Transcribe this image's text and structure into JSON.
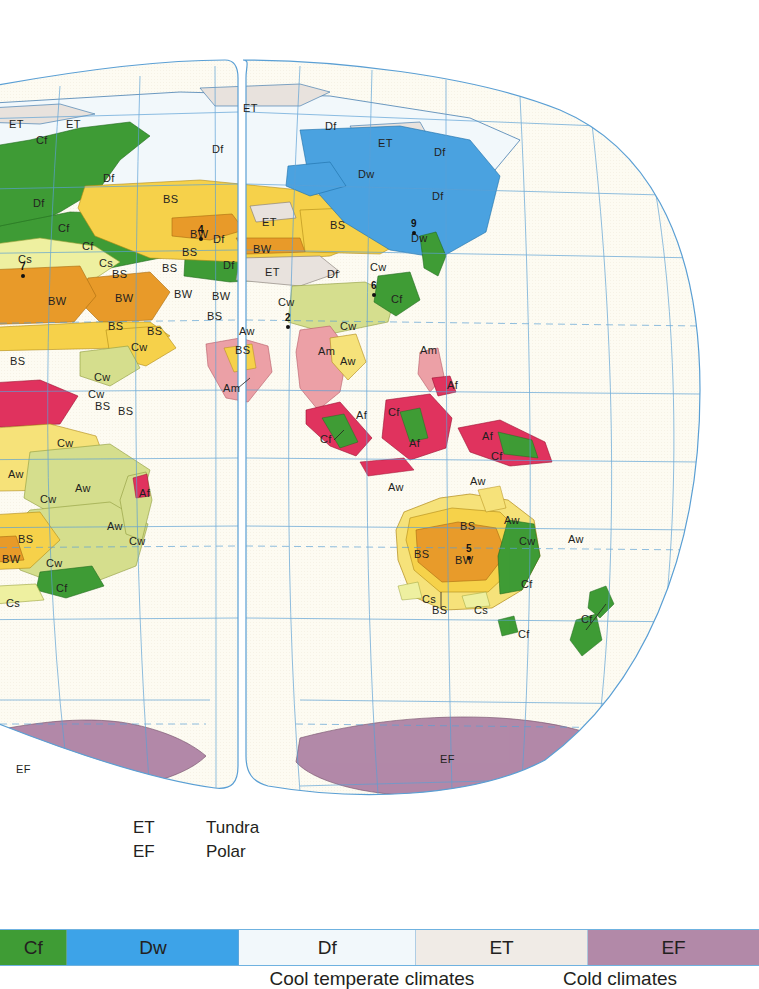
{
  "document": {
    "kind": "climate-classification-map",
    "region_shown": "Eastern Hemisphere — Europe, Asia, Africa, Australia, Antarctica"
  },
  "map": {
    "projection": "interrupted-oval",
    "background_color": "#fdfbf2",
    "graticule_color": "#5a9fd4",
    "coastline_color": "#2f6fa8",
    "labels": [
      {
        "text": "ET",
        "x": 9,
        "y": 118
      },
      {
        "text": "ET",
        "x": 66,
        "y": 118
      },
      {
        "text": "Cf",
        "x": 36,
        "y": 134
      },
      {
        "text": "ET",
        "x": 243,
        "y": 102
      },
      {
        "text": "Df",
        "x": 325,
        "y": 120
      },
      {
        "text": "ET",
        "x": 378,
        "y": 137
      },
      {
        "text": "Df",
        "x": 434,
        "y": 146
      },
      {
        "text": "Df",
        "x": 103,
        "y": 172
      },
      {
        "text": "Df",
        "x": 212,
        "y": 143
      },
      {
        "text": "Dw",
        "x": 358,
        "y": 168
      },
      {
        "text": "Df",
        "x": 432,
        "y": 190
      },
      {
        "text": "Cf",
        "x": 58,
        "y": 222
      },
      {
        "text": "BS",
        "x": 163,
        "y": 193
      },
      {
        "text": "BW",
        "x": 190,
        "y": 228
      },
      {
        "text": "ET",
        "x": 262,
        "y": 216
      },
      {
        "text": "BS",
        "x": 330,
        "y": 219
      },
      {
        "text": "Dw",
        "x": 411,
        "y": 232
      },
      {
        "text": "Df",
        "x": 33,
        "y": 197
      },
      {
        "text": "Cf",
        "x": 82,
        "y": 240
      },
      {
        "text": "BS",
        "x": 182,
        "y": 246
      },
      {
        "text": "Df",
        "x": 213,
        "y": 233
      },
      {
        "text": "BW",
        "x": 253,
        "y": 243
      },
      {
        "text": "Cs",
        "x": 18,
        "y": 253
      },
      {
        "text": "Cs",
        "x": 99,
        "y": 257
      },
      {
        "text": "BS",
        "x": 162,
        "y": 262
      },
      {
        "text": "Df",
        "x": 223,
        "y": 259
      },
      {
        "text": "ET",
        "x": 265,
        "y": 266
      },
      {
        "text": "Df",
        "x": 327,
        "y": 268
      },
      {
        "text": "Cw",
        "x": 370,
        "y": 261
      },
      {
        "text": "Cf",
        "x": 391,
        "y": 293
      },
      {
        "text": "BS",
        "x": 112,
        "y": 268
      },
      {
        "text": "BW",
        "x": 48,
        "y": 295
      },
      {
        "text": "BW",
        "x": 115,
        "y": 292
      },
      {
        "text": "BW",
        "x": 174,
        "y": 288
      },
      {
        "text": "BW",
        "x": 212,
        "y": 290
      },
      {
        "text": "Cw",
        "x": 278,
        "y": 296
      },
      {
        "text": "BS",
        "x": 108,
        "y": 320
      },
      {
        "text": "BS",
        "x": 147,
        "y": 325
      },
      {
        "text": "BS",
        "x": 207,
        "y": 310
      },
      {
        "text": "Cw",
        "x": 131,
        "y": 341
      },
      {
        "text": "Aw",
        "x": 239,
        "y": 325
      },
      {
        "text": "Cw",
        "x": 340,
        "y": 320
      },
      {
        "text": "BS",
        "x": 10,
        "y": 355
      },
      {
        "text": "BS",
        "x": 235,
        "y": 344
      },
      {
        "text": "Am",
        "x": 318,
        "y": 345
      },
      {
        "text": "Aw",
        "x": 340,
        "y": 355
      },
      {
        "text": "Am",
        "x": 420,
        "y": 344
      },
      {
        "text": "Cw",
        "x": 88,
        "y": 388
      },
      {
        "text": "Cw",
        "x": 94,
        "y": 371
      },
      {
        "text": "BS",
        "x": 95,
        "y": 400
      },
      {
        "text": "Am",
        "x": 223,
        "y": 382
      },
      {
        "text": "BS",
        "x": 118,
        "y": 405
      },
      {
        "text": "Af",
        "x": 447,
        "y": 379
      },
      {
        "text": "Af",
        "x": 356,
        "y": 409
      },
      {
        "text": "Cf",
        "x": 388,
        "y": 406
      },
      {
        "text": "Af",
        "x": 409,
        "y": 437
      },
      {
        "text": "Af",
        "x": 482,
        "y": 430
      },
      {
        "text": "Cf",
        "x": 320,
        "y": 433
      },
      {
        "text": "Cf",
        "x": 491,
        "y": 450
      },
      {
        "text": "Cw",
        "x": 57,
        "y": 437
      },
      {
        "text": "Aw",
        "x": 8,
        "y": 468
      },
      {
        "text": "Aw",
        "x": 75,
        "y": 482
      },
      {
        "text": "Aw",
        "x": 388,
        "y": 481
      },
      {
        "text": "Aw",
        "x": 470,
        "y": 475
      },
      {
        "text": "Cw",
        "x": 40,
        "y": 493
      },
      {
        "text": "Af",
        "x": 139,
        "y": 487
      },
      {
        "text": "Aw",
        "x": 107,
        "y": 520
      },
      {
        "text": "Cw",
        "x": 129,
        "y": 535
      },
      {
        "text": "BS",
        "x": 18,
        "y": 533
      },
      {
        "text": "BW",
        "x": 2,
        "y": 553
      },
      {
        "text": "Cw",
        "x": 46,
        "y": 557
      },
      {
        "text": "Cf",
        "x": 56,
        "y": 582
      },
      {
        "text": "Cs",
        "x": 6,
        "y": 597
      },
      {
        "text": "BS",
        "x": 460,
        "y": 520
      },
      {
        "text": "Aw",
        "x": 504,
        "y": 514
      },
      {
        "text": "Cw",
        "x": 519,
        "y": 535
      },
      {
        "text": "Aw",
        "x": 568,
        "y": 533
      },
      {
        "text": "BS",
        "x": 414,
        "y": 548
      },
      {
        "text": "BW",
        "x": 455,
        "y": 554
      },
      {
        "text": "Cf",
        "x": 521,
        "y": 578
      },
      {
        "text": "Cs",
        "x": 422,
        "y": 593
      },
      {
        "text": "BS",
        "x": 432,
        "y": 604
      },
      {
        "text": "Cs",
        "x": 474,
        "y": 604
      },
      {
        "text": "Cf",
        "x": 581,
        "y": 613
      },
      {
        "text": "Cf",
        "x": 518,
        "y": 628
      },
      {
        "text": "EF",
        "x": 440,
        "y": 753
      },
      {
        "text": "EF",
        "x": 16,
        "y": 763
      }
    ],
    "markers": [
      {
        "number": "7",
        "x": 20,
        "y": 261
      },
      {
        "number": "4",
        "x": 198,
        "y": 224
      },
      {
        "number": "9",
        "x": 411,
        "y": 218
      },
      {
        "number": "6",
        "x": 371,
        "y": 280
      },
      {
        "number": "2",
        "x": 285,
        "y": 312
      },
      {
        "number": "5",
        "x": 466,
        "y": 543
      }
    ]
  },
  "legend_list": {
    "rows": [
      {
        "code": "ET",
        "name": "Tundra"
      },
      {
        "code": "EF",
        "name": "Polar"
      }
    ]
  },
  "colorbar": {
    "segments": [
      {
        "label": "Cf",
        "color": "#3f9c35",
        "width": 140,
        "text_color": "#231f20"
      },
      {
        "label": "Dw",
        "color": "#3da3e8",
        "width": 360,
        "text_color": "#231f20"
      },
      {
        "label": "Df",
        "color": "#f2f8fb",
        "width": 370,
        "text_color": "#231f20"
      },
      {
        "label": "ET",
        "color": "#f0ebe6",
        "width": 360,
        "text_color": "#231f20"
      },
      {
        "label": "EF",
        "color": "#b289a8",
        "width": 360,
        "text_color": "#231f20"
      }
    ],
    "captions": [
      {
        "text": "Cool temperate climates",
        "center": 372
      },
      {
        "text": "Cold climates",
        "center": 620
      }
    ]
  },
  "palette": {
    "Af": "#e0335e",
    "Am": "#eca0a6",
    "Aw": "#f6e27a",
    "BS": "#f6d24a",
    "BW": "#e89b2a",
    "Cf": "#3f9c35",
    "Cs": "#eef0a0",
    "Cw": "#d5de8e",
    "Df": "#f2f8fb",
    "Dw": "#4ba3e0",
    "ET": "#e8e2dd",
    "EF": "#b289a8",
    "ocean": "#fdfbf2",
    "graticule": "#5a9fd4"
  }
}
